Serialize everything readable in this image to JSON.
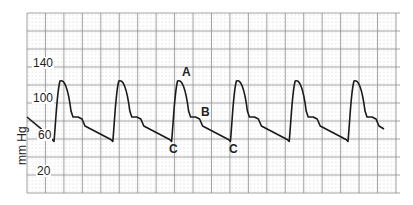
{
  "chart_data": {
    "type": "line",
    "title": "",
    "xlabel": "",
    "ylabel": "mm Hg",
    "ylim": [
      0,
      200
    ],
    "yticks": [
      20,
      60,
      100,
      140
    ],
    "grid": true,
    "legend": null,
    "series": [
      {
        "name": "arterial pressure waveform",
        "description": "Six cardiac cycles of arterial blood pressure; systolic peak ~120 mmHg, diastolic trough ~55 mmHg, dicrotic notch ~80 mmHg",
        "systolic_peak_mmHg": 120,
        "diastolic_trough_mmHg": 55,
        "dicrotic_notch_mmHg": 80,
        "cycles": 6
      }
    ],
    "annotations": [
      {
        "label": "A",
        "meaning": "systolic peak",
        "x_px": 187,
        "y_px": 73
      },
      {
        "label": "B",
        "meaning": "dicrotic notch",
        "x_px": 206,
        "y_px": 113
      },
      {
        "label": "C",
        "meaning": "end-diastole",
        "x_px": 174,
        "y_px": 150
      },
      {
        "label": "C",
        "meaning": "end-diastole",
        "x_px": 234,
        "y_px": 150
      }
    ]
  },
  "labels": {
    "y_axis_title": "mm Hg",
    "ticks": [
      "140",
      "100",
      "60",
      "20"
    ],
    "annotations": [
      "A",
      "B",
      "C",
      "C"
    ]
  },
  "colors": {
    "grid_major": "#8a8a8a",
    "grid_minor": "#c0c0c0",
    "trace": "#1a1a1a",
    "text": "#222222"
  }
}
